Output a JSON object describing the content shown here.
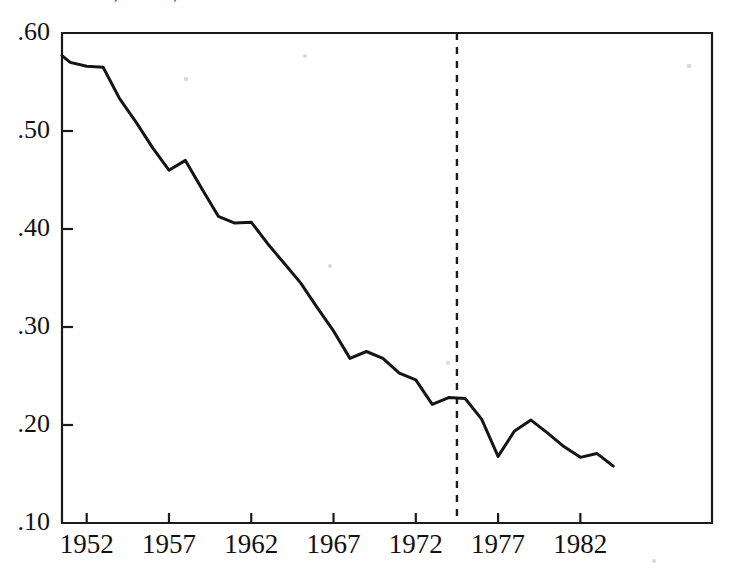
{
  "page": {
    "background_color": "#ffffff",
    "ink_color": "#151515",
    "header_partial_text": "— —— ——— ,— —— , ———————— ——"
  },
  "chart_data": {
    "type": "line",
    "title": "",
    "subtitle": "",
    "xlabel": "",
    "ylabel": "",
    "xlim": [
      1950.5,
      1990.0
    ],
    "ylim": [
      0.1,
      0.6
    ],
    "grid": false,
    "legend_position": "none",
    "x_tick_labels": [
      "1952",
      "1957",
      "1962",
      "1967",
      "1972",
      "1977",
      "1982"
    ],
    "x_ticks": [
      1952,
      1957,
      1962,
      1967,
      1972,
      1977,
      1982
    ],
    "y_tick_labels": [
      ".60",
      ".50",
      ".40",
      ".30",
      ".20",
      ".10"
    ],
    "y_ticks": [
      0.6,
      0.5,
      0.4,
      0.3,
      0.2,
      0.1
    ],
    "series": [
      {
        "name": "series-1",
        "color": "#151515",
        "style": "solid",
        "x": [
          1950.5,
          1951,
          1952,
          1953,
          1954,
          1955,
          1956,
          1957,
          1958,
          1959,
          1960,
          1961,
          1962,
          1963,
          1964,
          1965,
          1966,
          1967,
          1968,
          1969,
          1970,
          1971,
          1972,
          1973,
          1974,
          1975,
          1976,
          1977,
          1978,
          1979,
          1980,
          1981,
          1982,
          1983,
          1984
        ],
        "values": [
          0.577,
          0.57,
          0.566,
          0.565,
          0.533,
          0.509,
          0.483,
          0.46,
          0.47,
          0.441,
          0.413,
          0.406,
          0.407,
          0.385,
          0.365,
          0.345,
          0.32,
          0.296,
          0.268,
          0.275,
          0.268,
          0.253,
          0.246,
          0.221,
          0.228,
          0.227,
          0.206,
          0.168,
          0.194,
          0.205,
          0.192,
          0.178,
          0.167,
          0.171,
          0.158
        ]
      }
    ],
    "annotations": [
      {
        "name": "event-marker",
        "type": "vline",
        "x": 1974.5,
        "style": "dashed",
        "label": ""
      }
    ],
    "notes": {
      "peak_value": 0.577,
      "peak_x": 1950.5,
      "min_value": 0.158,
      "min_x": 1984,
      "value_at_event": 0.168,
      "event_x": 1974.5
    }
  }
}
